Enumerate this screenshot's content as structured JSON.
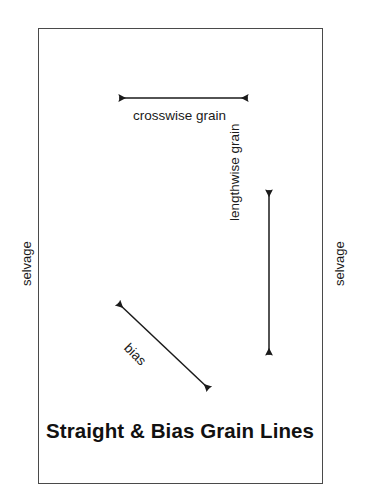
{
  "diagram": {
    "title": "Straight & Bias Grain Lines",
    "background_color": "#ffffff",
    "line_color": "#1a1a1a",
    "border_color": "#4a4a4a",
    "labels": {
      "crosswise_grain": "crosswise grain",
      "lengthwise_grain": "lengthwise grain",
      "bias": "bias",
      "selvage_left": "selvage",
      "selvage_right": "selvage"
    },
    "arrows": [
      {
        "name": "crosswise-grain-arrow",
        "heads": "double",
        "orientation": "horizontal",
        "x1": 117,
        "y1": 98,
        "x2": 250,
        "y2": 98
      },
      {
        "name": "lengthwise-grain-arrow",
        "heads": "double",
        "orientation": "vertical",
        "x1": 269,
        "y1": 188,
        "x2": 269,
        "y2": 357
      },
      {
        "name": "bias-arrow",
        "heads": "double",
        "orientation": "diagonal",
        "x1": 116,
        "y1": 301,
        "x2": 211,
        "y2": 391
      }
    ],
    "fabric_rect": {
      "x": 38,
      "y": 28,
      "width": 285,
      "height": 456
    }
  }
}
